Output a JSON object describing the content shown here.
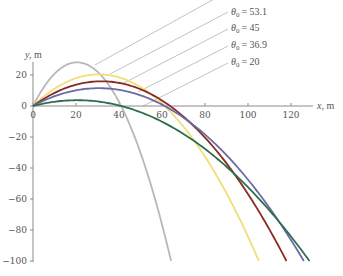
{
  "chart_data": {
    "type": "line",
    "title": "",
    "xlabel": "x, m",
    "ylabel": "y, m",
    "xlim": [
      0,
      130
    ],
    "ylim": [
      -100,
      28
    ],
    "grid": false,
    "x_ticks": [
      0,
      20,
      40,
      60,
      80,
      100,
      120
    ],
    "x_tick_labels": [
      "0",
      "20",
      "40",
      "60",
      "80",
      "100",
      "120"
    ],
    "y_ticks": [
      20,
      0,
      -20,
      -40,
      -60,
      -80,
      -100
    ],
    "y_tick_labels": [
      "20",
      "0",
      "−20",
      "−40",
      "−60",
      "−80",
      "−100"
    ],
    "legend_position": "top-right, leader lines to curves",
    "physics": {
      "v0_m_per_s": 25,
      "g_m_per_s2": 9.8,
      "y_floor": -100
    },
    "series": [
      {
        "name": "gray (label cropped)",
        "label": "",
        "theta0_deg": 70,
        "color": "#b8b8b8",
        "peak": [
          21.4,
          28.2
        ],
        "x_at_y0": 41.0,
        "x_at_y_minus_100": 64.2
      },
      {
        "name": "θ0 = 53.1",
        "label": "= 53.1",
        "theta0_deg": 53.1,
        "color": "#f0de78",
        "peak": [
          30.6,
          20.4
        ],
        "x_at_y0": 61.2,
        "x_at_y_minus_100": 102.0
      },
      {
        "name": "θ0 = 45",
        "label": "= 45",
        "theta0_deg": 45,
        "color": "#8a2a20",
        "peak": [
          31.9,
          15.9
        ],
        "x_at_y0": 63.8,
        "x_at_y_minus_100": 116.0
      },
      {
        "name": "θ0 = 36.9",
        "label": "= 36.9",
        "theta0_deg": 36.9,
        "color": "#6b6aa6",
        "peak": [
          30.6,
          11.5
        ],
        "x_at_y0": 61.2,
        "x_at_y_minus_100": 124.5
      },
      {
        "name": "θ0 = 20",
        "label": "= 20",
        "theta0_deg": 20,
        "color": "#2f6e4c",
        "peak": [
          20.5,
          3.7
        ],
        "x_at_y0": 41.0,
        "x_at_y_minus_100": 128.5
      }
    ]
  },
  "legend": {
    "theta_symbol": "θ",
    "subscript": "0",
    "items": [
      {
        "label": "= 53.1"
      },
      {
        "label": "= 45"
      },
      {
        "label": "= 36.9"
      },
      {
        "label": "= 20"
      }
    ]
  },
  "axes": {
    "x_label_var": "x,",
    "x_label_unit": " m",
    "y_label_var": "y,",
    "y_label_unit": " m"
  }
}
